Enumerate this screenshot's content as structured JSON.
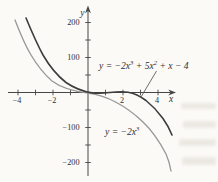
{
  "figure": {
    "bg_color": "#fbfaf7",
    "axis_color": "#474747",
    "curve_dark_color": "#3d3d3d",
    "curve_gray_color": "#979797"
  },
  "labels": {
    "x_axis": "x",
    "y_axis": "y",
    "eq_full": {
      "p1": "y = −2x",
      "sup1": "3",
      "p2": " + 5x",
      "sup2": "2",
      "p3": " + x − 4"
    },
    "eq_simple": {
      "p1": "y = −2x",
      "sup1": "3"
    }
  },
  "axes_px": {
    "origin_x": 88,
    "origin_y": 92.5,
    "px_per_x_unit": 17.5,
    "px_per_y_unit": 0.35
  },
  "chart_data": {
    "type": "line",
    "title": "",
    "xlabel": "x",
    "ylabel": "y",
    "xlim": [
      -4.6,
      5.0
    ],
    "ylim": [
      -230,
      235
    ],
    "grid": false,
    "x_ticks": [
      -4,
      -3,
      -2,
      -1,
      1,
      2,
      3,
      4
    ],
    "y_ticks": [
      -200,
      -150,
      -100,
      -50,
      50,
      100,
      150,
      200
    ],
    "x_tick_labels": [
      {
        "v": -4,
        "t": "−4"
      },
      {
        "v": -2,
        "t": "−2"
      },
      {
        "v": 2,
        "t": "2"
      },
      {
        "v": 4,
        "t": "4"
      }
    ],
    "y_tick_labels": [
      {
        "v": 200,
        "t": "200"
      },
      {
        "v": 100,
        "t": "100"
      },
      {
        "v": -100,
        "t": "−100"
      },
      {
        "v": -200,
        "t": "−200"
      }
    ],
    "series": [
      {
        "name": "y = -2x^3 + 5x^2 + x - 4",
        "color": "#3d3d3d",
        "x": [
          -4.3,
          -4,
          -3,
          -2,
          -1,
          -0.85,
          0,
          1,
          1.95,
          2.35,
          3,
          4,
          4.8
        ],
        "values": [
          232,
          200,
          92,
          30,
          2,
          0,
          -4,
          0,
          2.9,
          0,
          -10,
          -48,
          -105
        ]
      },
      {
        "name": "y = -2x^3",
        "color": "#979797",
        "x": [
          -4.85,
          -4,
          -3,
          -2,
          -1,
          0,
          1,
          2,
          3,
          4,
          4.7
        ],
        "values": [
          228,
          128,
          54,
          16,
          2,
          0,
          -2,
          -16,
          -54,
          -128,
          -208
        ]
      }
    ],
    "annotations": [
      {
        "text": "y = -2x^3 + 5x^2 + x - 4",
        "attached_to": "series 0",
        "leader_line": true
      },
      {
        "text": "y = -2x^3",
        "attached_to": "series 1",
        "leader_line": false
      }
    ],
    "legend_position": "none"
  }
}
